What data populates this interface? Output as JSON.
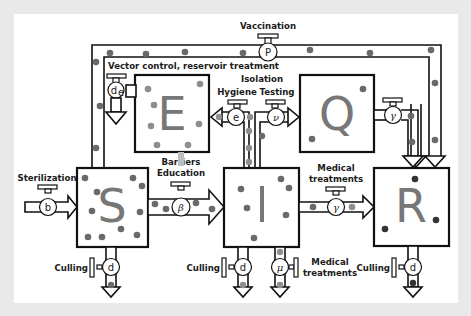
{
  "diagram": {
    "colors": {
      "background": "#e9e9e9",
      "panel": "#ffffff",
      "stroke": "#111111",
      "compartment_letter": "#777777",
      "particle_dark": "#6a6a6a",
      "particle_light": "#8e8e8e",
      "particle_recovered": "#333333"
    },
    "compartments": [
      {
        "id": "S",
        "label": "S"
      },
      {
        "id": "E",
        "label": "E"
      },
      {
        "id": "I",
        "label": "I"
      },
      {
        "id": "Q",
        "label": "Q"
      },
      {
        "id": "R",
        "label": "R"
      }
    ],
    "valves": {
      "vaccination": {
        "symbol": "P",
        "label": "Vaccination"
      },
      "vector_control": {
        "symbol": "d",
        "subscript": "e",
        "label": "Vector control, reservoir treatment"
      },
      "hygiene": {
        "symbol": "e",
        "label": "Hygiene"
      },
      "isolation": {
        "label": "Isolation"
      },
      "testing": {
        "symbol": "ν",
        "label": "Testing"
      },
      "q_recovery": {
        "symbol": "γ"
      },
      "sterilization": {
        "symbol": "b",
        "label": "Sterilization"
      },
      "transmission": {
        "symbol": "β",
        "label_line1": "Barriers",
        "label_line2": "Education"
      },
      "i_recovery": {
        "symbol": "γ",
        "label_line1": "Medical",
        "label_line2": "treatments"
      },
      "culling_s": {
        "symbol": "d",
        "label": "Culling"
      },
      "culling_i": {
        "symbol": "d",
        "label": "Culling"
      },
      "disease_mortality": {
        "symbol": "μ",
        "label_line1": "Medical",
        "label_line2": "treatments"
      },
      "culling_r": {
        "symbol": "d",
        "label": "Culling"
      }
    }
  }
}
